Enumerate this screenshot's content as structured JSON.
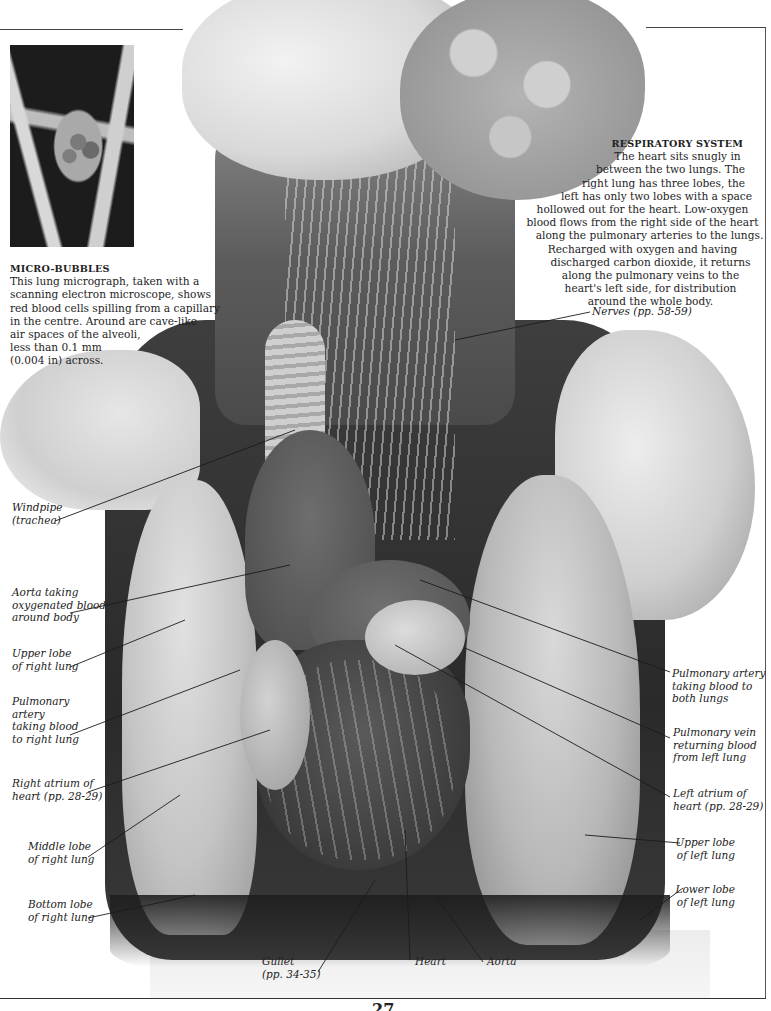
{
  "page": {
    "number": "27",
    "colors": {
      "background": "#ffffff",
      "text": "#1e1e1e",
      "rule": "#444444"
    }
  },
  "figures": {
    "main_photo": {
      "subject": "anatomical-model-torso-respiratory-system",
      "tone": "grayscale"
    },
    "micrograph": {
      "subject": "lung-micrograph-alveoli",
      "tone": "grayscale"
    }
  },
  "micro_caption": {
    "heading": "MICRO-BUBBLES",
    "lines": [
      "This lung micrograph, taken with a",
      "scanning electron microscope, shows",
      "red blood cells spilling from a capillary",
      "in the centre. Around are cave-like",
      "air spaces of the alveoli,",
      "less than 0.1 mm",
      "(0.004 in) across."
    ]
  },
  "respiratory_caption": {
    "heading": "RESPIRATORY SYSTEM",
    "lines": [
      "The heart sits snugly in",
      "between the two lungs. The",
      "right lung has three lobes, the",
      "left has only two lobes with a space",
      "hollowed out for the heart. Low-oxygen",
      "blood flows from the right side of the heart",
      "along the pulmonary arteries to the lungs.",
      "Recharged with oxygen and having",
      "discharged carbon dioxide, it returns",
      "along the pulmonary veins to the",
      "heart's left side, for distribution",
      "around the whole body."
    ]
  },
  "labels": {
    "nerves": {
      "lines": [
        "Nerves (pp. 58-59)"
      ]
    },
    "windpipe": {
      "lines": [
        "Windpipe",
        "(trachea)"
      ]
    },
    "aorta_body": {
      "lines": [
        "Aorta taking",
        "oxygenated blood",
        "around body"
      ]
    },
    "upper_lobe_right": {
      "lines": [
        "Upper lobe",
        "of right lung"
      ]
    },
    "pulmonary_artery_right": {
      "lines": [
        "Pulmonary",
        "artery",
        "taking blood",
        "to right lung"
      ]
    },
    "right_atrium": {
      "lines": [
        "Right atrium of",
        "heart (pp. 28-29)"
      ]
    },
    "middle_lobe_right": {
      "lines": [
        "Middle lobe",
        "of right lung"
      ]
    },
    "bottom_lobe_right": {
      "lines": [
        "Bottom lobe",
        "of right lung"
      ]
    },
    "pulmonary_artery_both": {
      "lines": [
        "Pulmonary artery",
        "taking blood to",
        "both lungs"
      ]
    },
    "pulmonary_vein": {
      "lines": [
        "Pulmonary vein",
        "returning blood",
        "from left lung"
      ]
    },
    "left_atrium": {
      "lines": [
        "Left atrium of",
        "heart (pp. 28-29)"
      ]
    },
    "upper_lobe_left": {
      "lines": [
        "Upper lobe",
        "of left lung"
      ]
    },
    "lower_lobe_left": {
      "lines": [
        "Lower lobe",
        "of left lung"
      ]
    },
    "gullet": {
      "lines": [
        "Gullet",
        "(pp. 34-35)"
      ]
    },
    "heart": {
      "lines": [
        "Heart"
      ]
    },
    "aorta": {
      "lines": [
        "Aorta"
      ]
    }
  }
}
